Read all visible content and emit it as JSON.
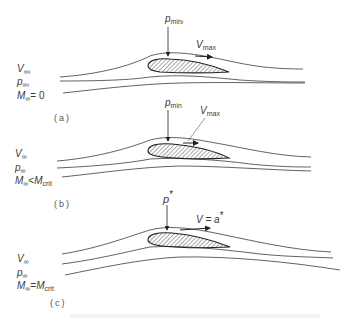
{
  "figure": {
    "panels": [
      {
        "id": "a",
        "caption": "(a)",
        "freestream": {
          "velocity": {
            "sym": "V",
            "sub": "∞",
            "sub2": "i"
          },
          "pressure": {
            "sym": "p",
            "sub": "∞",
            "sub2": "i"
          },
          "mach": {
            "sym": "M",
            "sub": "∞",
            "rel": "= 0",
            "rhs": ""
          }
        },
        "pressure_label": {
          "sym": "p",
          "sub": "min",
          "sub2": "i"
        },
        "velocity_label": {
          "sym": "V",
          "sub": "max",
          "rest": ""
        }
      },
      {
        "id": "b",
        "caption": "(b)",
        "freestream": {
          "velocity": {
            "sym": "V",
            "sub": "∞"
          },
          "pressure": {
            "sym": "p",
            "sub": "∞"
          },
          "mach": {
            "sym": "M",
            "sub": "∞",
            "rel": "<",
            "rhs_sym": "M",
            "rhs_sub": "crit"
          }
        },
        "pressure_label": {
          "sym": "p",
          "sub": "min"
        },
        "velocity_label": {
          "sym": "V",
          "sub": "max"
        }
      },
      {
        "id": "c",
        "caption": "(c)",
        "freestream": {
          "velocity": {
            "sym": "V",
            "sub": "∞"
          },
          "pressure": {
            "sym": "p",
            "sub": "∞"
          },
          "mach": {
            "sym": "M",
            "sub": "∞",
            "rel": "=",
            "rhs_sym": "M",
            "rhs_sub": "crit"
          }
        },
        "pressure_label": {
          "sym": "p",
          "sup": "*"
        },
        "velocity_label": {
          "text": "V = a",
          "sup": "*"
        }
      }
    ],
    "colors": {
      "line": "#3a3a3a",
      "hatch": "#555555",
      "text": "#3a3a3a"
    }
  }
}
